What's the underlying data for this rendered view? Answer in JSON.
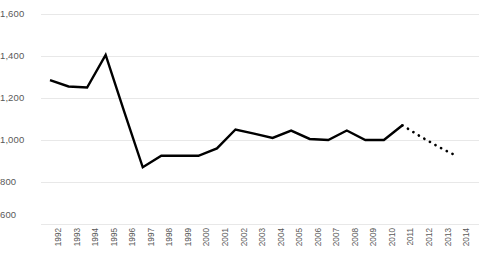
{
  "chart_data": {
    "type": "line",
    "title": "",
    "xlabel": "",
    "ylabel": "",
    "ylim": [
      600,
      1600
    ],
    "ytick_values": [
      1600,
      1400,
      1200,
      1000,
      800,
      600
    ],
    "ytick_labels": [
      "1,600",
      "1,400",
      "1,200",
      "1,000",
      "800",
      "600"
    ],
    "grid": true,
    "legend": "none",
    "categories": [
      "1992",
      "1993",
      "1994",
      "1995",
      "1996",
      "1997",
      "1998",
      "1999",
      "2000",
      "2001",
      "2002",
      "2003",
      "2004",
      "2005",
      "2006",
      "2007",
      "2008",
      "2009",
      "2010",
      "2011",
      "2012",
      "2013",
      "2014"
    ],
    "series": [
      {
        "name": "actual",
        "style": "solid",
        "color": "#000000",
        "x": [
          "1992",
          "1993",
          "1994",
          "1995",
          "1996",
          "1997",
          "1998",
          "1999",
          "2000",
          "2001",
          "2002",
          "2003",
          "2004",
          "2005",
          "2006",
          "2007",
          "2008",
          "2009",
          "2010",
          "2011"
        ],
        "values": [
          1285,
          1255,
          1250,
          1405,
          1135,
          870,
          925,
          925,
          925,
          960,
          1050,
          1030,
          1010,
          1045,
          1005,
          1000,
          1045,
          1000,
          1000,
          1070
        ]
      },
      {
        "name": "forecast",
        "style": "dotted",
        "color": "#000000",
        "x": [
          "2011",
          "2012",
          "2013",
          "2014"
        ],
        "values": [
          1070,
          1015,
          965,
          920
        ]
      }
    ]
  },
  "axis": {
    "y_axis_name": "y-axis",
    "x_axis_name": "x-axis"
  }
}
